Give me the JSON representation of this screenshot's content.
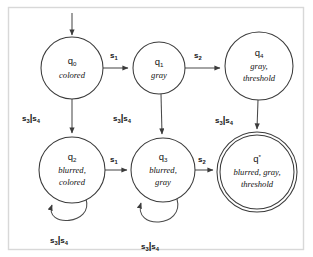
{
  "figure": {
    "type": "finite-state-machine",
    "caption": "",
    "frame_color": "#d8d8d8",
    "stroke_color": "#3b3b3b",
    "background": "#ffffff"
  },
  "states": [
    {
      "key": "q0",
      "id": "q",
      "subscript": "0",
      "attributes": [
        "colored"
      ],
      "accepting": false,
      "initial": true,
      "cx": 72,
      "cy": 68,
      "r": 31
    },
    {
      "key": "q1",
      "id": "q",
      "subscript": "1",
      "attributes": [
        "gray"
      ],
      "accepting": false,
      "initial": false,
      "cx": 159,
      "cy": 68,
      "r": 26
    },
    {
      "key": "q4",
      "id": "q",
      "subscript": "4",
      "attributes": [
        "gray,",
        "threshold"
      ],
      "accepting": false,
      "initial": false,
      "cx": 259,
      "cy": 66,
      "r": 34
    },
    {
      "key": "q2",
      "id": "q",
      "subscript": "2",
      "attributes": [
        "blurred,",
        "colored"
      ],
      "accepting": false,
      "initial": false,
      "cx": 72,
      "cy": 170,
      "r": 33
    },
    {
      "key": "q3",
      "id": "q",
      "subscript": "3",
      "attributes": [
        "blurred,",
        "gray"
      ],
      "accepting": false,
      "initial": false,
      "cx": 163,
      "cy": 170,
      "r": 32
    },
    {
      "key": "qstar",
      "id": "q",
      "subscript": "*",
      "attributes": [
        "blurred, gray,",
        "threshold"
      ],
      "accepting": true,
      "initial": false,
      "cx": 257,
      "cy": 172,
      "r": 40
    }
  ],
  "transitions": [
    {
      "key": "start-q0",
      "from": "start",
      "to": "q0",
      "label": "",
      "sub": "",
      "shape": "start-arrow"
    },
    {
      "key": "q0-q1",
      "from": "q0",
      "to": "q1",
      "label": "s",
      "sub": "1",
      "shape": "horizontal"
    },
    {
      "key": "q1-q4",
      "from": "q1",
      "to": "q4",
      "label": "s",
      "sub": "2",
      "shape": "horizontal"
    },
    {
      "key": "q0-q2",
      "from": "q0",
      "to": "q2",
      "label": "s3|s4",
      "sub": "",
      "shape": "vertical"
    },
    {
      "key": "q1-q3",
      "from": "q1",
      "to": "q3",
      "label": "s3|s4",
      "sub": "",
      "shape": "vertical"
    },
    {
      "key": "q4-qstar",
      "from": "q4",
      "to": "qstar",
      "label": "s3|s4",
      "sub": "",
      "shape": "vertical"
    },
    {
      "key": "q2-q3",
      "from": "q2",
      "to": "q3",
      "label": "s",
      "sub": "1",
      "shape": "horizontal"
    },
    {
      "key": "q3-qstar",
      "from": "q3",
      "to": "qstar",
      "label": "s",
      "sub": "2",
      "shape": "horizontal"
    },
    {
      "key": "q2-q2",
      "from": "q2",
      "to": "q2",
      "label": "s3|s4",
      "sub": "",
      "shape": "self-loop"
    },
    {
      "key": "q3-q3",
      "from": "q3",
      "to": "q3",
      "label": "s3|s4",
      "sub": "",
      "shape": "self-loop"
    }
  ],
  "edge_labels": {
    "s1_top": {
      "base": "s",
      "sub": "1"
    },
    "s2_top": {
      "base": "s",
      "sub": "2"
    },
    "s1_bottom": {
      "base": "s",
      "sub": "1"
    },
    "s2_bottom": {
      "base": "s",
      "sub": "2"
    },
    "s34_left": {
      "a_base": "s",
      "a_sub": "3",
      "bar": "|",
      "b_base": "s",
      "b_sub": "4"
    },
    "s34_mid": {
      "a_base": "s",
      "a_sub": "3",
      "bar": "|",
      "b_base": "s",
      "b_sub": "4"
    },
    "s34_right": {
      "a_base": "s",
      "a_sub": "3",
      "bar": "|",
      "b_base": "s",
      "b_sub": "4"
    },
    "s34_loop_left": {
      "a_base": "s",
      "a_sub": "3",
      "bar": "|",
      "b_base": "s",
      "b_sub": "4"
    },
    "s34_loop_mid": {
      "a_base": "s",
      "a_sub": "3",
      "bar": "|",
      "b_base": "s",
      "b_sub": "4"
    }
  }
}
